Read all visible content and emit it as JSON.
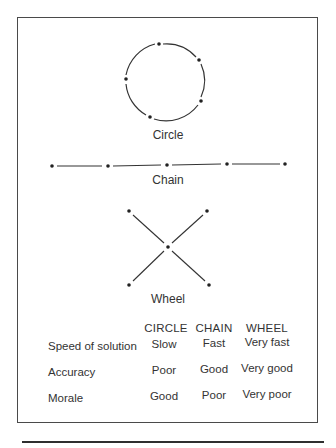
{
  "diagrams": {
    "circle": {
      "label": "Circle",
      "center": [
        159,
        80
      ],
      "radius": 40,
      "nodes": [
        [
          159,
          44
        ],
        [
          199,
          60
        ],
        [
          126,
          79
        ],
        [
          201,
          101
        ],
        [
          150,
          117
        ]
      ]
    },
    "chain": {
      "label": "Chain",
      "y": 165,
      "nodes": [
        52,
        108,
        167,
        227,
        285
      ]
    },
    "wheel": {
      "label": "Wheel",
      "center": [
        168,
        247
      ],
      "nodes": [
        [
          129,
          211
        ],
        [
          207,
          211
        ],
        [
          129,
          285
        ],
        [
          209,
          285
        ]
      ]
    }
  },
  "table": {
    "columns": [
      "CIRCLE",
      "CHAIN",
      "WHEEL"
    ],
    "rows": [
      {
        "label": "Speed of solution",
        "values": [
          "Slow",
          "Fast",
          "Very fast"
        ]
      },
      {
        "label": "Accuracy",
        "values": [
          "Poor",
          "Good",
          "Very good"
        ]
      },
      {
        "label": "Morale",
        "values": [
          "Good",
          "Poor",
          "Very poor"
        ]
      }
    ]
  },
  "colors": {
    "ink": "#2a2a2a",
    "frame": "#4a4a4a",
    "background": "#ffffff"
  }
}
